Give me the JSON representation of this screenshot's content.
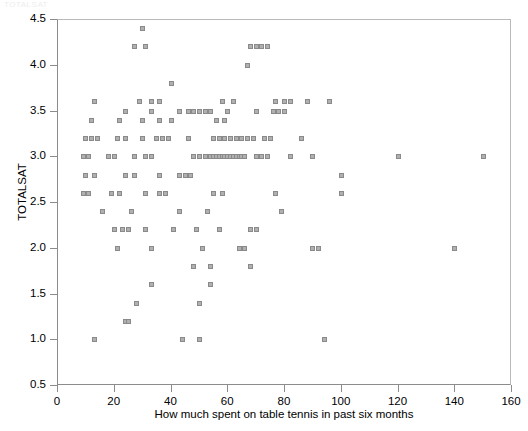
{
  "title_remnant": "TOTALSAT",
  "chart_data": {
    "type": "scatter",
    "title": "",
    "xlabel": "How much spent on table tennis in past six months",
    "ylabel": "TOTALSAT",
    "xlim": [
      0,
      160
    ],
    "ylim": [
      0.5,
      4.5
    ],
    "xticks": [
      0,
      20,
      40,
      60,
      80,
      100,
      120,
      140,
      160
    ],
    "yticks": [
      0.5,
      1.0,
      1.5,
      2.0,
      2.5,
      3.0,
      3.5,
      4.0,
      4.5
    ],
    "xtick_labels": [
      "0",
      "20",
      "40",
      "60",
      "80",
      "100",
      "120",
      "140",
      "160"
    ],
    "ytick_labels": [
      "0.5",
      "1.0",
      "1.5",
      "2.0",
      "2.5",
      "3.0",
      "3.5",
      "4.0",
      "4.5"
    ],
    "grid": false,
    "legend": null,
    "marker": "square",
    "marker_color": "#b0b0b0",
    "marker_edge_color": "#8a8a8a",
    "points": [
      [
        30,
        4.4
      ],
      [
        27,
        4.2
      ],
      [
        31,
        4.2
      ],
      [
        68,
        4.2
      ],
      [
        70,
        4.2
      ],
      [
        72,
        4.2
      ],
      [
        74,
        4.2
      ],
      [
        67,
        4.0
      ],
      [
        40,
        3.8
      ],
      [
        13,
        3.6
      ],
      [
        29,
        3.6
      ],
      [
        33,
        3.6
      ],
      [
        36,
        3.6
      ],
      [
        58,
        3.6
      ],
      [
        62,
        3.6
      ],
      [
        77,
        3.6
      ],
      [
        80,
        3.6
      ],
      [
        82,
        3.6
      ],
      [
        88,
        3.6
      ],
      [
        96,
        3.6
      ],
      [
        24,
        3.5
      ],
      [
        33,
        3.5
      ],
      [
        43,
        3.5
      ],
      [
        46,
        3.5
      ],
      [
        48,
        3.5
      ],
      [
        50,
        3.5
      ],
      [
        52,
        3.5
      ],
      [
        54,
        3.5
      ],
      [
        60,
        3.5
      ],
      [
        70,
        3.5
      ],
      [
        76,
        3.5
      ],
      [
        78,
        3.5
      ],
      [
        80,
        3.5
      ],
      [
        12,
        3.4
      ],
      [
        22,
        3.4
      ],
      [
        30,
        3.4
      ],
      [
        36,
        3.4
      ],
      [
        40,
        3.4
      ],
      [
        56,
        3.4
      ],
      [
        59,
        3.4
      ],
      [
        10,
        3.2
      ],
      [
        12,
        3.2
      ],
      [
        14,
        3.2
      ],
      [
        21,
        3.2
      ],
      [
        24,
        3.2
      ],
      [
        30,
        3.2
      ],
      [
        35,
        3.2
      ],
      [
        37,
        3.2
      ],
      [
        39,
        3.2
      ],
      [
        46,
        3.2
      ],
      [
        55,
        3.2
      ],
      [
        57,
        3.2
      ],
      [
        59,
        3.2
      ],
      [
        61,
        3.2
      ],
      [
        63,
        3.2
      ],
      [
        65,
        3.2
      ],
      [
        67,
        3.2
      ],
      [
        69,
        3.2
      ],
      [
        73,
        3.2
      ],
      [
        75,
        3.2
      ],
      [
        86,
        3.2
      ],
      [
        9,
        3.0
      ],
      [
        11,
        3.0
      ],
      [
        18,
        3.0
      ],
      [
        20,
        3.0
      ],
      [
        27,
        3.0
      ],
      [
        31,
        3.0
      ],
      [
        33,
        3.0
      ],
      [
        48,
        3.0
      ],
      [
        50,
        3.0
      ],
      [
        52,
        3.0
      ],
      [
        54,
        3.0
      ],
      [
        55,
        3.0
      ],
      [
        56,
        3.0
      ],
      [
        57,
        3.0
      ],
      [
        58,
        3.0
      ],
      [
        59,
        3.0
      ],
      [
        60,
        3.0
      ],
      [
        61,
        3.0
      ],
      [
        62,
        3.0
      ],
      [
        63,
        3.0
      ],
      [
        64,
        3.0
      ],
      [
        65,
        3.0
      ],
      [
        66,
        3.0
      ],
      [
        70,
        3.0
      ],
      [
        72,
        3.0
      ],
      [
        74,
        3.0
      ],
      [
        82,
        3.0
      ],
      [
        90,
        3.0
      ],
      [
        120,
        3.0
      ],
      [
        150,
        3.0
      ],
      [
        10,
        2.8
      ],
      [
        13,
        2.8
      ],
      [
        24,
        2.8
      ],
      [
        27,
        2.8
      ],
      [
        36,
        2.8
      ],
      [
        43,
        2.8
      ],
      [
        45,
        2.8
      ],
      [
        47,
        2.8
      ],
      [
        100,
        2.8
      ],
      [
        9,
        2.6
      ],
      [
        11,
        2.6
      ],
      [
        19,
        2.6
      ],
      [
        22,
        2.6
      ],
      [
        31,
        2.6
      ],
      [
        36,
        2.6
      ],
      [
        38,
        2.6
      ],
      [
        55,
        2.6
      ],
      [
        58,
        2.6
      ],
      [
        77,
        2.6
      ],
      [
        100,
        2.6
      ],
      [
        16,
        2.4
      ],
      [
        26,
        2.4
      ],
      [
        43,
        2.4
      ],
      [
        53,
        2.4
      ],
      [
        79,
        2.4
      ],
      [
        20,
        2.2
      ],
      [
        23,
        2.2
      ],
      [
        25,
        2.2
      ],
      [
        31,
        2.2
      ],
      [
        41,
        2.2
      ],
      [
        49,
        2.2
      ],
      [
        57,
        2.2
      ],
      [
        68,
        2.2
      ],
      [
        70,
        2.2
      ],
      [
        21,
        2.0
      ],
      [
        33,
        2.0
      ],
      [
        51,
        2.0
      ],
      [
        64,
        2.0
      ],
      [
        66,
        2.0
      ],
      [
        90,
        2.0
      ],
      [
        92,
        2.0
      ],
      [
        140,
        2.0
      ],
      [
        48,
        1.8
      ],
      [
        54,
        1.8
      ],
      [
        68,
        1.8
      ],
      [
        33,
        1.6
      ],
      [
        54,
        1.6
      ],
      [
        28,
        1.4
      ],
      [
        50,
        1.4
      ],
      [
        24,
        1.2
      ],
      [
        25,
        1.2
      ],
      [
        13,
        1.0
      ],
      [
        44,
        1.0
      ],
      [
        50,
        1.0
      ],
      [
        94,
        1.0
      ]
    ]
  }
}
